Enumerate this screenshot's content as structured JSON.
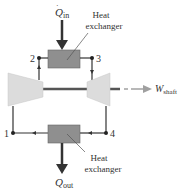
{
  "diagram": {
    "heat_in": {
      "symbol": "Q",
      "subscript": "in"
    },
    "heat_out": {
      "symbol": "Q",
      "subscript": "out"
    },
    "work_out": {
      "symbol": "W",
      "subscript": "shaft"
    },
    "heat_exchanger_top": {
      "line1": "Heat",
      "line2": "exchanger"
    },
    "heat_exchanger_bottom": {
      "line1": "Heat",
      "line2": "exchanger"
    },
    "states": [
      {
        "id": "1",
        "label": "1"
      },
      {
        "id": "2",
        "label": "2"
      },
      {
        "id": "3",
        "label": "3"
      },
      {
        "id": "4",
        "label": "4"
      }
    ],
    "components": [
      "compressor",
      "turbine",
      "heat-exchanger-top",
      "heat-exchanger-bottom",
      "shaft"
    ],
    "colors": {
      "heat_exchanger": "#8f8f8f",
      "machine": "#dcdcdc",
      "line": "#333333",
      "shaft": "#555555",
      "shaft_arrow": "#a0a0a0"
    }
  }
}
